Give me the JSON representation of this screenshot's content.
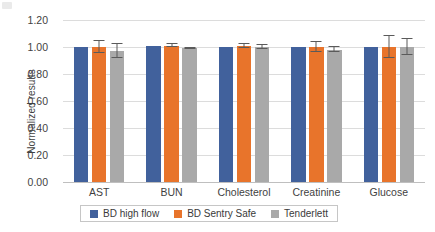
{
  "chart_data": {
    "type": "bar",
    "title": "",
    "xlabel": "",
    "ylabel": "Normalized results",
    "ylim": [
      0.0,
      1.2
    ],
    "yticks": [
      "0.00",
      "0.20",
      "0.40",
      "0.60",
      "0.80",
      "1.00",
      "1.20"
    ],
    "ytick_values": [
      0.0,
      0.2,
      0.4,
      0.6,
      0.8,
      1.0,
      1.2
    ],
    "grid": true,
    "legend_position": "bottom",
    "categories": [
      "AST",
      "BUN",
      "Cholesterol",
      "Creatinine",
      "Glucose"
    ],
    "series": [
      {
        "name": "BD high flow",
        "color": "#41619C",
        "values": [
          1.0,
          1.01,
          1.0,
          1.0,
          1.0
        ],
        "errors": [
          0.0,
          0.0,
          0.0,
          0.0,
          0.0
        ]
      },
      {
        "name": "BD Sentry Safe",
        "color": "#E8742B",
        "values": [
          1.0,
          1.01,
          1.01,
          1.0,
          1.0
        ],
        "errors": [
          0.045,
          0.012,
          0.015,
          0.035,
          0.085
        ]
      },
      {
        "name": "Tenderlett",
        "color": "#A9A9A9",
        "values": [
          0.97,
          0.99,
          1.0,
          0.98,
          1.0
        ],
        "errors": [
          0.055,
          0.006,
          0.012,
          0.018,
          0.06
        ]
      }
    ]
  },
  "legend": {
    "items": [
      {
        "label": "BD high flow"
      },
      {
        "label": "BD Sentry Safe"
      },
      {
        "label": "Tenderlett"
      }
    ]
  },
  "axis": {
    "y_title": "Normalized results"
  }
}
